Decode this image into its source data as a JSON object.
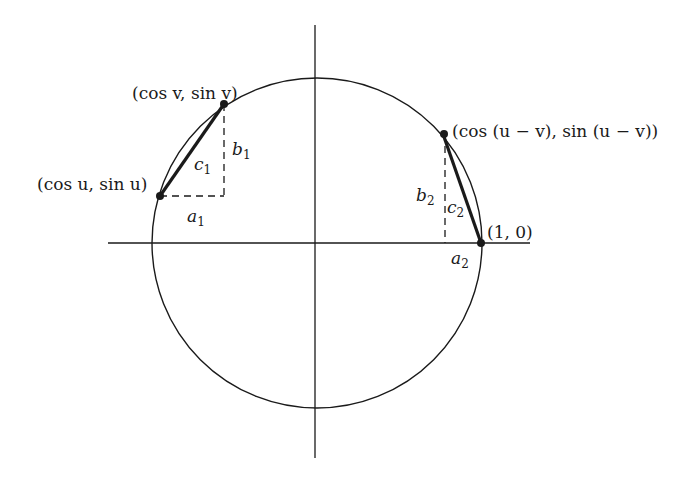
{
  "diagram": {
    "type": "unit-circle",
    "points": {
      "v": {
        "label": "(cos v, sin v)"
      },
      "u": {
        "label": "(cos u, sin u)"
      },
      "uv": {
        "label": "(cos (u − v), sin (u − v))"
      },
      "one": {
        "label": "(1, 0)"
      }
    },
    "segments": {
      "a1": {
        "base": "a",
        "sub": "1"
      },
      "b1": {
        "base": "b",
        "sub": "1"
      },
      "c1": {
        "base": "c",
        "sub": "1"
      },
      "a2": {
        "base": "a",
        "sub": "2"
      },
      "b2": {
        "base": "b",
        "sub": "2"
      },
      "c2": {
        "base": "c",
        "sub": "2"
      }
    },
    "colors": {
      "ink": "#1a1a1a",
      "background": "#ffffff"
    }
  }
}
